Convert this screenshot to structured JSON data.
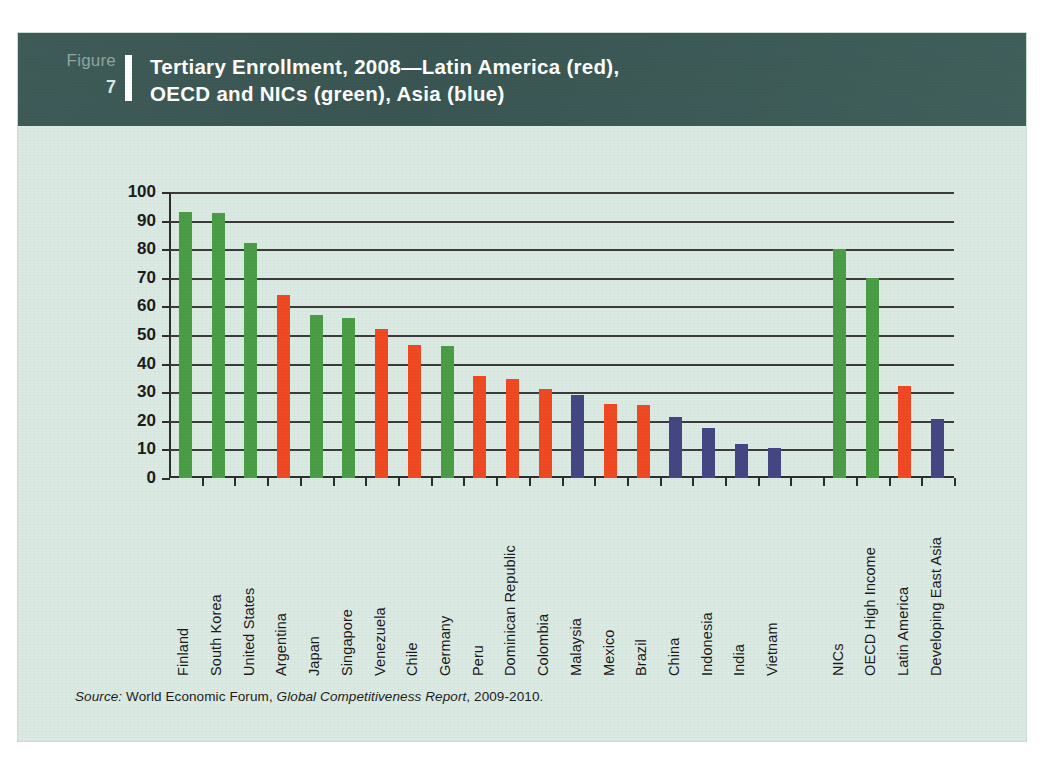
{
  "figure": {
    "label_word": "Figure",
    "number": "7",
    "title_line1": "Tertiary Enrollment, 2008—Latin America (red),",
    "title_line2": "OECD and NICs (green), Asia (blue)"
  },
  "source": {
    "prefix": "Source:",
    "publisher": "World Economic Forum,",
    "report": "Global Competitiveness Report",
    "years": ", 2009-2010."
  },
  "colors": {
    "header_band": "#3d5a57",
    "card_background": "#dceae4",
    "green": "#4a9e46",
    "red": "#f04a23",
    "blue": "#454784",
    "axis": "#2e2e2e"
  },
  "chart_data": {
    "type": "bar",
    "title": "Tertiary Enrollment, 2008—Latin America (red), OECD and NICs (green), Asia (blue)",
    "xlabel": "",
    "ylabel": "",
    "ylim": [
      0,
      100
    ],
    "yticks": [
      0,
      10,
      20,
      30,
      40,
      50,
      60,
      70,
      80,
      90,
      100
    ],
    "grid": true,
    "legend": "none",
    "legend_note": "Latin America (red), OECD and NICs (green), Asia (blue)",
    "categories": [
      "Finland",
      "South Korea",
      "United States",
      "Argentina",
      "Japan",
      "Singapore",
      "Venezuela",
      "Chile",
      "Germany",
      "Peru",
      "Dominican Republic",
      "Colombia",
      "Malaysia",
      "Mexico",
      "Brazil",
      "China",
      "Indonesia",
      "India",
      "Vietnam",
      "",
      "NICs",
      "OECD High Income",
      "Latin America",
      "Developing East Asia"
    ],
    "values": [
      93,
      92.5,
      82,
      64,
      57,
      56,
      52,
      46.5,
      46,
      35.5,
      34.5,
      31,
      29,
      26,
      25.5,
      21.5,
      17.5,
      12,
      10.5,
      null,
      80,
      70,
      32,
      20.5
    ],
    "groups": [
      "green",
      "green",
      "green",
      "red",
      "green",
      "green",
      "red",
      "red",
      "green",
      "red",
      "red",
      "red",
      "blue",
      "red",
      "red",
      "blue",
      "blue",
      "blue",
      "blue",
      "none",
      "green",
      "green",
      "red",
      "blue"
    ]
  }
}
